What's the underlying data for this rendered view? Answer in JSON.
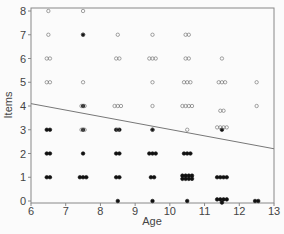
{
  "chart_data": {
    "type": "scatter",
    "title": "",
    "xlabel": "Age",
    "ylabel": "Items",
    "xlim": [
      6,
      13
    ],
    "ylim": [
      0,
      8
    ],
    "x_ticks": [
      "6",
      "7",
      "8",
      "9",
      "10",
      "11",
      "12",
      "13"
    ],
    "y_ticks": [
      "0",
      "1",
      "2",
      "3",
      "4",
      "5",
      "6",
      "7",
      "8"
    ],
    "grid": false,
    "legend": null,
    "regression_line": {
      "x": [
        6,
        13
      ],
      "y": [
        4.1,
        2.2
      ]
    },
    "series": [
      {
        "name": "below line (filled)",
        "marker": "filled-circle",
        "points": [
          {
            "x": 6.5,
            "y": 3,
            "n": 2
          },
          {
            "x": 6.5,
            "y": 2,
            "n": 2
          },
          {
            "x": 6.5,
            "y": 1,
            "n": 2
          },
          {
            "x": 7.5,
            "y": 7,
            "n": 1
          },
          {
            "x": 7.5,
            "y": 4,
            "n": 1
          },
          {
            "x": 7.5,
            "y": 3,
            "n": 1
          },
          {
            "x": 7.5,
            "y": 2,
            "n": 1
          },
          {
            "x": 7.5,
            "y": 1,
            "n": 3
          },
          {
            "x": 8.5,
            "y": 3,
            "n": 2
          },
          {
            "x": 8.5,
            "y": 2,
            "n": 2
          },
          {
            "x": 8.5,
            "y": 1,
            "n": 2
          },
          {
            "x": 8.5,
            "y": 0,
            "n": 1
          },
          {
            "x": 9.5,
            "y": 3,
            "n": 1
          },
          {
            "x": 9.5,
            "y": 2,
            "n": 3
          },
          {
            "x": 9.5,
            "y": 1,
            "n": 2
          },
          {
            "x": 9.5,
            "y": 0,
            "n": 1
          },
          {
            "x": 10.5,
            "y": 2,
            "n": 3
          },
          {
            "x": 10.5,
            "y": 1,
            "n": 8
          },
          {
            "x": 10.5,
            "y": 0,
            "n": 1
          },
          {
            "x": 11.5,
            "y": 3,
            "n": 1
          },
          {
            "x": 11.5,
            "y": 1,
            "n": 4
          },
          {
            "x": 11.5,
            "y": 0,
            "n": 5
          },
          {
            "x": 12.5,
            "y": 0,
            "n": 2
          }
        ]
      },
      {
        "name": "above line (open)",
        "marker": "open-circle",
        "points": [
          {
            "x": 6.5,
            "y": 8,
            "n": 1
          },
          {
            "x": 6.5,
            "y": 7,
            "n": 1
          },
          {
            "x": 6.5,
            "y": 6,
            "n": 2
          },
          {
            "x": 6.5,
            "y": 5,
            "n": 2
          },
          {
            "x": 7.5,
            "y": 8,
            "n": 1
          },
          {
            "x": 7.5,
            "y": 7,
            "n": 1
          },
          {
            "x": 7.5,
            "y": 5,
            "n": 1
          },
          {
            "x": 7.5,
            "y": 4,
            "n": 2
          },
          {
            "x": 7.5,
            "y": 3,
            "n": 2
          },
          {
            "x": 8.5,
            "y": 7,
            "n": 1
          },
          {
            "x": 8.5,
            "y": 6,
            "n": 2
          },
          {
            "x": 8.5,
            "y": 4,
            "n": 3
          },
          {
            "x": 8.5,
            "y": 3,
            "n": 1
          },
          {
            "x": 9.5,
            "y": 7,
            "n": 1
          },
          {
            "x": 9.5,
            "y": 6,
            "n": 3
          },
          {
            "x": 9.5,
            "y": 5,
            "n": 1
          },
          {
            "x": 9.5,
            "y": 4,
            "n": 1
          },
          {
            "x": 9.5,
            "y": 3,
            "n": 1
          },
          {
            "x": 10.5,
            "y": 7,
            "n": 2
          },
          {
            "x": 10.5,
            "y": 6,
            "n": 2
          },
          {
            "x": 10.5,
            "y": 5,
            "n": 3
          },
          {
            "x": 10.5,
            "y": 4,
            "n": 4
          },
          {
            "x": 10.5,
            "y": 3,
            "n": 1
          },
          {
            "x": 11.5,
            "y": 6,
            "n": 1
          },
          {
            "x": 11.5,
            "y": 5,
            "n": 3
          },
          {
            "x": 11.5,
            "y": 3.8,
            "n": 2
          },
          {
            "x": 11.5,
            "y": 3.1,
            "n": 4
          },
          {
            "x": 12.5,
            "y": 5,
            "n": 1
          },
          {
            "x": 12.5,
            "y": 4,
            "n": 1
          }
        ]
      }
    ]
  }
}
